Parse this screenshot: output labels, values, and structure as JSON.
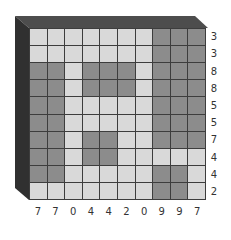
{
  "puzzle": {
    "rows": 10,
    "cols": 10,
    "colors": {
      "filled": "#8c8c8c",
      "empty": "#d9d9d9",
      "grid_line": "#3d3d3d",
      "frame_top": "#4d4d4d",
      "frame_left": "#303030"
    },
    "row_counts": [
      "3",
      "3",
      "8",
      "8",
      "5",
      "5",
      "7",
      "4",
      "4",
      "2"
    ],
    "col_counts": [
      "7",
      "7",
      "0",
      "4",
      "4",
      "2",
      "0",
      "9",
      "9",
      "7"
    ],
    "cells": [
      [
        0,
        0,
        0,
        0,
        0,
        0,
        0,
        1,
        1,
        1
      ],
      [
        0,
        0,
        0,
        0,
        0,
        0,
        0,
        1,
        1,
        1
      ],
      [
        1,
        1,
        0,
        1,
        1,
        1,
        0,
        1,
        1,
        1
      ],
      [
        1,
        1,
        0,
        1,
        1,
        1,
        0,
        1,
        1,
        1
      ],
      [
        1,
        1,
        0,
        0,
        0,
        0,
        0,
        1,
        1,
        1
      ],
      [
        1,
        1,
        0,
        0,
        0,
        0,
        0,
        1,
        1,
        1
      ],
      [
        1,
        1,
        0,
        1,
        1,
        0,
        0,
        1,
        1,
        1
      ],
      [
        1,
        1,
        0,
        1,
        1,
        0,
        0,
        0,
        0,
        0
      ],
      [
        1,
        1,
        0,
        0,
        0,
        0,
        0,
        1,
        1,
        0
      ],
      [
        0,
        0,
        0,
        0,
        0,
        0,
        0,
        1,
        1,
        0
      ]
    ]
  }
}
